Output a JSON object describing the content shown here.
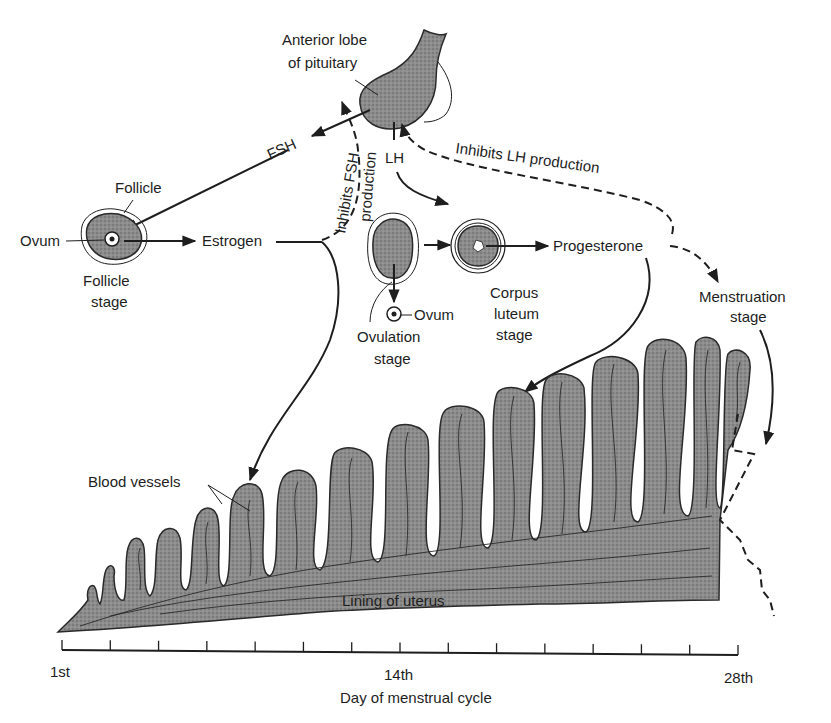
{
  "diagram": {
    "colors": {
      "ink": "#1e1e1e",
      "tissue": "#8a8a8a",
      "background": "#ffffff"
    },
    "labels": {
      "pituitary_line1": "Anterior lobe",
      "pituitary_line2": "of pituitary",
      "fsh": "FSH",
      "lh": "LH",
      "inhibits_fsh_line1": "Inhibits FSH",
      "inhibits_fsh_line2": "production",
      "inhibits_lh": "Inhibits LH production",
      "follicle": "Follicle",
      "ovum_left": "Ovum",
      "follicle_stage_line1": "Follicle",
      "follicle_stage_line2": "stage",
      "estrogen": "Estrogen",
      "ovum_ovulation": "Ovum",
      "ovulation_stage_line1": "Ovulation",
      "ovulation_stage_line2": "stage",
      "corpus_line1": "Corpus",
      "corpus_line2": "luteum",
      "corpus_line3": "stage",
      "progesterone": "Progesterone",
      "menstruation_line1": "Menstruation",
      "menstruation_line2": "stage",
      "blood_vessels": "Blood vessels",
      "lining_of_uterus": "Lining of uterus"
    },
    "axis": {
      "tick_count": 15,
      "tick_labels": [
        {
          "text": "1st",
          "position": 0
        },
        {
          "text": "14th",
          "position": 7
        },
        {
          "text": "28th",
          "position": 14
        }
      ],
      "title": "Day of menstrual cycle"
    },
    "nodes": [
      {
        "id": "pituitary",
        "label": "Anterior lobe of pituitary"
      },
      {
        "id": "follicle_stage",
        "label": "Follicle stage"
      },
      {
        "id": "ovulation_stage",
        "label": "Ovulation stage"
      },
      {
        "id": "corpus_luteum_stage",
        "label": "Corpus luteum stage"
      },
      {
        "id": "menstruation_stage",
        "label": "Menstruation stage"
      },
      {
        "id": "uterus_lining",
        "label": "Lining of uterus"
      }
    ],
    "edges": [
      {
        "from": "pituitary",
        "to": "follicle_stage",
        "label": "FSH",
        "style": "solid"
      },
      {
        "from": "pituitary",
        "to": "corpus_luteum_stage",
        "label": "LH",
        "style": "solid"
      },
      {
        "from": "follicle_stage",
        "to": "estrogen",
        "style": "solid"
      },
      {
        "from": "estrogen",
        "to": "pituitary",
        "label": "Inhibits FSH production",
        "style": "dashed"
      },
      {
        "from": "estrogen",
        "to": "uterus_lining",
        "style": "solid"
      },
      {
        "from": "ovulation_stage",
        "to": "corpus_luteum_stage",
        "style": "solid"
      },
      {
        "from": "ovulation_stage",
        "to": "ovum",
        "style": "solid"
      },
      {
        "from": "corpus_luteum_stage",
        "to": "progesterone",
        "style": "solid"
      },
      {
        "from": "progesterone",
        "to": "pituitary",
        "label": "Inhibits LH production",
        "style": "dashed"
      },
      {
        "from": "progesterone",
        "to": "menstruation_stage",
        "style": "dashed"
      },
      {
        "from": "progesterone",
        "to": "uterus_lining",
        "style": "solid"
      },
      {
        "from": "menstruation_stage",
        "to": "uterus_lining",
        "style": "solid"
      }
    ]
  }
}
